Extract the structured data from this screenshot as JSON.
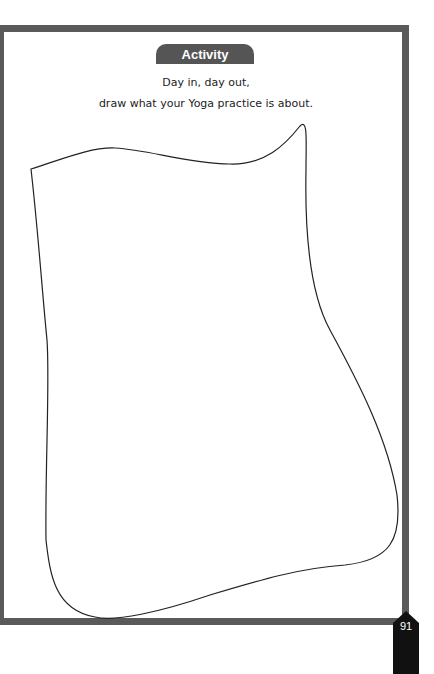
{
  "activity": {
    "title": "Activity",
    "line1": "Day in, day out,",
    "line2": "draw what your Yoga practice is about."
  },
  "page": {
    "number": "91"
  },
  "colors": {
    "border": "#5a5a5a",
    "tab": "#555555",
    "badge": "#111111"
  }
}
